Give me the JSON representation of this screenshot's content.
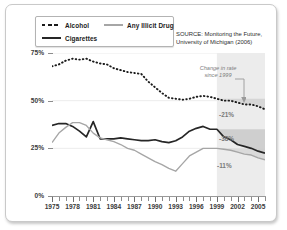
{
  "legend": {
    "items": [
      {
        "label": "Alcohol",
        "style": "dashed-black",
        "color": "#1a1a1a"
      },
      {
        "label": "Cigarettes",
        "style": "solid-black",
        "color": "#262626"
      },
      {
        "label": "Any Illicit Drug",
        "style": "solid-gray",
        "color": "#a6a6a6"
      }
    ]
  },
  "source": {
    "line1": "SOURCE: Monitoring the Future,",
    "line2": "University of Michigan (2006)"
  },
  "annotation": {
    "line1": "Change in rate",
    "line2": "since 1999",
    "arrow": "down-arrow-icon"
  },
  "change_labels": {
    "alcohol": "-21%",
    "cigarettes": "-38%",
    "illicit_drug": "-11%"
  },
  "chart_data": {
    "type": "line",
    "title": "",
    "xlabel": "",
    "ylabel": "",
    "xlim": [
      1975,
      2006
    ],
    "ylim": [
      0,
      75
    ],
    "yticks": [
      0,
      25,
      50,
      75
    ],
    "ytick_labels": [
      "0%",
      "25%",
      "50%",
      "75%"
    ],
    "xticks": [
      1975,
      1978,
      1981,
      1984,
      1987,
      1990,
      1993,
      1996,
      1999,
      2002,
      2005
    ],
    "xtick_labels": [
      "1975",
      "1978",
      "1981",
      "1984",
      "1987",
      "1990",
      "1993",
      "1996",
      "1999",
      "2002",
      "2005"
    ],
    "minor_xticks_every": 1,
    "grid": "horizontal",
    "legend_position": "top-left",
    "highlight_region": {
      "from": 1999,
      "to": 2006,
      "fill": "#e6e6e6"
    },
    "x": [
      1975,
      1976,
      1977,
      1978,
      1979,
      1980,
      1981,
      1982,
      1983,
      1984,
      1985,
      1986,
      1987,
      1988,
      1989,
      1990,
      1991,
      1992,
      1993,
      1994,
      1995,
      1996,
      1997,
      1998,
      1999,
      2000,
      2001,
      2002,
      2003,
      2004,
      2005,
      2006
    ],
    "series": [
      {
        "name": "Alcohol",
        "color": "#1a1a1a",
        "style": "dashed",
        "values": [
          68,
          69,
          71,
          72,
          71.5,
          72,
          70.5,
          69.5,
          69,
          67,
          66,
          65,
          64.5,
          64,
          60,
          57,
          54,
          51.5,
          51,
          50.5,
          51,
          52,
          52.5,
          52,
          51,
          50,
          50,
          49,
          48,
          48,
          47,
          45.5
        ]
      },
      {
        "name": "Cigarettes",
        "color": "#262626",
        "style": "solid",
        "values": [
          37,
          38,
          38,
          36.5,
          34,
          31,
          39,
          30,
          30,
          30,
          30.5,
          30,
          29.5,
          29,
          29,
          29.5,
          28.5,
          28,
          29,
          31,
          34,
          35.5,
          36.5,
          35,
          35,
          31,
          29.5,
          27,
          26,
          25,
          23.5,
          22.5
        ]
      },
      {
        "name": "Any Illicit Drug",
        "color": "#a6a6a6",
        "style": "solid",
        "values": [
          28,
          33,
          36,
          38.5,
          38.5,
          37,
          33,
          30.5,
          29.5,
          28.5,
          27,
          25,
          24,
          22,
          20,
          18,
          16.5,
          14.5,
          13,
          17,
          21,
          23,
          25,
          25,
          25,
          24.5,
          24,
          23,
          22,
          21.5,
          20,
          19
        ]
      }
    ]
  }
}
